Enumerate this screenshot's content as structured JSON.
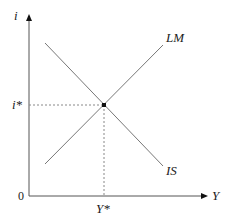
{
  "diagram": {
    "type": "IS-LM model",
    "axes": {
      "y_label": "i",
      "x_label": "Y",
      "origin_label": "0"
    },
    "curves": [
      {
        "name": "LM",
        "label": "LM",
        "slope": "upward"
      },
      {
        "name": "IS",
        "label": "IS",
        "slope": "downward"
      }
    ],
    "equilibrium": {
      "y_value_label": "i*",
      "x_value_label": "Y*"
    },
    "colors": {
      "axis": "#555555",
      "curve": "#777777",
      "guide": "#888888",
      "point": "#111111"
    }
  }
}
